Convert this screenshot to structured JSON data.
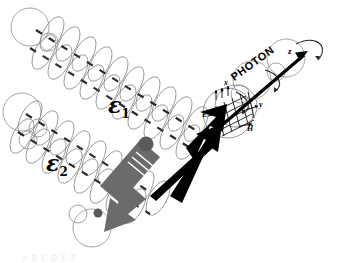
{
  "figure": {
    "background_color": "#ffffff",
    "width": 338,
    "height": 263
  },
  "labels": {
    "epsilon1": "ε",
    "epsilon1_sub": "1",
    "epsilon2": "ε",
    "epsilon2_sub": "2",
    "photon": "PHOTON",
    "axis_x": "x",
    "axis_y": "y",
    "axis_z": "z",
    "field_E": "E",
    "field_H": "H"
  },
  "colors": {
    "ink": "#000000",
    "wave_line": "#8c8c8c",
    "dash_mark": "#2b2b2b",
    "gray_arrow": "#6b6b6b",
    "gray_arrow_dark": "#4a4a4a",
    "node_dot": "#5a5a5a",
    "background": "#ffffff"
  },
  "elements": {
    "wave_train_1_name": "circular-polarization-wave-epsilon-1",
    "wave_train_2_name": "circular-polarization-wave-epsilon-2",
    "gray_arrow_name": "incident-beam-arrow",
    "black_arrow_name": "photon-propagation-arrow",
    "mesh_circle_name": "photon-field-mesh-circle",
    "spin_curve_name": "photon-spin-rotation-curve"
  },
  "caption_ghost": "A     B         C            D              E       F"
}
